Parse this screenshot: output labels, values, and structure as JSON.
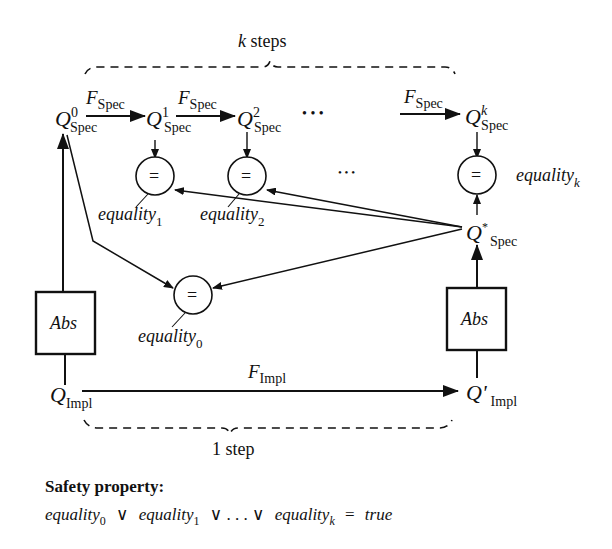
{
  "diagram": {
    "top_brace_label": {
      "var": "k",
      "text": " steps"
    },
    "bottom_brace_label": "1 step",
    "spec_states": [
      {
        "base": "Q",
        "sup": "0",
        "sub": "Spec"
      },
      {
        "base": "Q",
        "sup": "1",
        "sub": "Spec"
      },
      {
        "base": "Q",
        "sup": "2",
        "sub": "Spec"
      },
      {
        "base": "Q",
        "sup": "k",
        "sub": "Spec"
      }
    ],
    "spec_star": {
      "base": "Q",
      "sup": "*",
      "sub": "Spec"
    },
    "impl_states": [
      {
        "base": "Q",
        "sub": "Impl"
      },
      {
        "base": "Q'",
        "sub": "Impl"
      }
    ],
    "transitions": {
      "spec": {
        "base": "F",
        "sub": "Spec"
      },
      "impl": {
        "base": "F",
        "sub": "Impl"
      }
    },
    "ellipsis_top": "•   •   •",
    "ellipsis_mid": "•   •   •",
    "comparators": [
      {
        "symbol": "=",
        "label": "equality",
        "sub": "0"
      },
      {
        "symbol": "=",
        "label": "equality",
        "sub": "1"
      },
      {
        "symbol": "=",
        "label": "equality",
        "sub": "2"
      },
      {
        "symbol": "=",
        "label": "equality",
        "sub": "k"
      }
    ],
    "abstraction_boxes": [
      {
        "label": "Abs"
      },
      {
        "label": "Abs"
      }
    ]
  },
  "safety": {
    "title": "Safety property:",
    "formula": {
      "t0": "equality",
      "s0": "0",
      "or1": "∨",
      "t1": "equality",
      "s1": "1",
      "or2": "∨ . . . ∨",
      "tk": "equality",
      "sk": "k",
      "eq": "=",
      "rhs": "true"
    }
  }
}
